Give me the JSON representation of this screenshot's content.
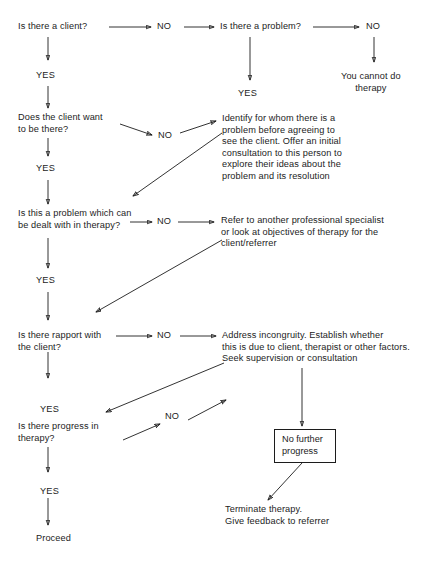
{
  "diagram": {
    "ink_color": "#1c1c1c",
    "background": "#ffffff",
    "nodes": {
      "q_client": "Is there a client?",
      "q_problem": "Is there a problem?",
      "cannot_do": "You cannot do\ntherapy",
      "q_want": "Does the client want\nto be there?",
      "identify": "Identify for whom there is a\nproblem before agreeing to\nsee the client. Offer an initial\nconsultation to this person to\nexplore their ideas about the\nproblem and its resolution",
      "q_dealt": "Is this a problem which can\nbe dealt with in therapy?",
      "refer": "Refer to another professional specialist\nor look at objectives of therapy for the\nclient/referrer",
      "q_rapport": "Is there rapport with\nthe client?",
      "address": "Address incongruity. Establish whether\nthis is due to client, therapist or other factors.\nSeek supervision or consultation",
      "q_progress": "Is there progress in\ntherapy?",
      "no_further": "No further\nprogress",
      "terminate": "Terminate therapy.\nGive feedback to referrer",
      "proceed": "Proceed"
    },
    "edge_labels": {
      "no_1": "NO",
      "no_2": "NO",
      "no_3": "NO",
      "no_4": "NO",
      "no_5": "NO",
      "no_6": "NO",
      "yes_1": "YES",
      "yes_2": "YES",
      "yes_3": "YES",
      "yes_4": "YES",
      "yes_5": "YES",
      "yes_6": "YES"
    }
  }
}
